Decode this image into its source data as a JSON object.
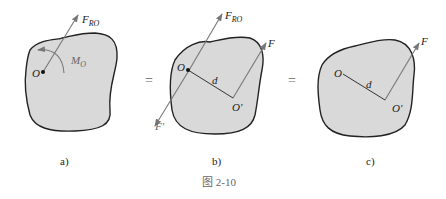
{
  "figure": {
    "caption": "图 2-10",
    "panels": [
      {
        "id": "a",
        "label": "a)",
        "point": "O",
        "force_label": "F",
        "force_sub": "RO",
        "moment_label": "M",
        "moment_sub": "O"
      },
      {
        "id": "b",
        "label": "b)",
        "point": "O",
        "point2": "O′",
        "distance": "d",
        "force_label": "F",
        "force_sub": "RO",
        "force2": "F",
        "force3": "F′"
      },
      {
        "id": "c",
        "label": "c)",
        "point": "O",
        "point2": "O′",
        "distance": "d",
        "force2": "F"
      }
    ],
    "equals": [
      "=",
      "="
    ],
    "colors": {
      "body_fill": "#d9d9d9",
      "outline": "#222222",
      "force": "#777777"
    }
  }
}
